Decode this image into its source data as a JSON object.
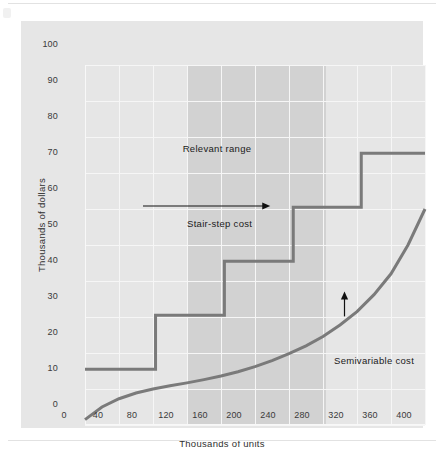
{
  "figure": {
    "background_color": "#e6e6e6",
    "panel_color": "#e6e6e6"
  },
  "chart_data": {
    "type": "line",
    "title": "",
    "xlabel": "Thousands of units",
    "ylabel": "Thousands of dollars",
    "xlim": [
      0,
      400
    ],
    "ylim": [
      0,
      100
    ],
    "grid": true,
    "legend": "none",
    "xticks": [
      0,
      40,
      80,
      120,
      160,
      200,
      240,
      280,
      320,
      360,
      400
    ],
    "xtick_labels": [
      "0",
      "40",
      "80",
      "120",
      "160",
      "200",
      "240",
      "280",
      "320",
      "360",
      "400"
    ],
    "yticks": [
      0,
      10,
      20,
      30,
      40,
      50,
      60,
      70,
      80,
      90,
      100
    ],
    "ytick_labels": [
      "0",
      "10",
      "20",
      "30",
      "40",
      "50",
      "60",
      "70",
      "80",
      "90",
      "100"
    ],
    "series": [
      {
        "name": "Stair-step cost",
        "type": "step",
        "color": "#7a7a7a",
        "line_width": 3,
        "steps": [
          {
            "x_start": 0,
            "x_end": 83,
            "y": 15.5
          },
          {
            "x_start": 83,
            "x_end": 164,
            "y": 30.5
          },
          {
            "x_start": 164,
            "x_end": 245,
            "y": 45.5
          },
          {
            "x_start": 245,
            "x_end": 325,
            "y": 60.5
          },
          {
            "x_start": 325,
            "x_end": 400,
            "y": 75.5
          }
        ]
      },
      {
        "name": "Semivariable cost",
        "type": "curve",
        "color": "#7a7a7a",
        "line_width": 3,
        "x": [
          0,
          20,
          40,
          60,
          80,
          100,
          120,
          140,
          160,
          180,
          200,
          220,
          240,
          260,
          280,
          300,
          320,
          340,
          360,
          380,
          400
        ],
        "y": [
          1.5,
          5.0,
          7.3,
          8.9,
          10.0,
          10.9,
          11.7,
          12.6,
          13.6,
          14.8,
          16.2,
          17.9,
          19.8,
          22.0,
          24.6,
          27.8,
          31.5,
          36.2,
          42.0,
          50.0,
          60.0
        ]
      }
    ],
    "shaded_regions": [
      {
        "label": "Relevant range",
        "x_start": 120,
        "x_end": 283,
        "color": "#d2d2d2"
      }
    ],
    "annotations": [
      {
        "name": "relevant-range",
        "text": "Relevant range",
        "x": 200,
        "y": 78
      },
      {
        "name": "stair-step-cost",
        "text": "Stair-step cost",
        "x": 150,
        "y": 55,
        "arrow": "right",
        "arrow_to_x": 245
      },
      {
        "name": "semivariable-cost",
        "text": "Semivariable cost",
        "x": 330,
        "y": 21,
        "arrow": "up",
        "arrow_to_y": 31.5
      }
    ]
  }
}
